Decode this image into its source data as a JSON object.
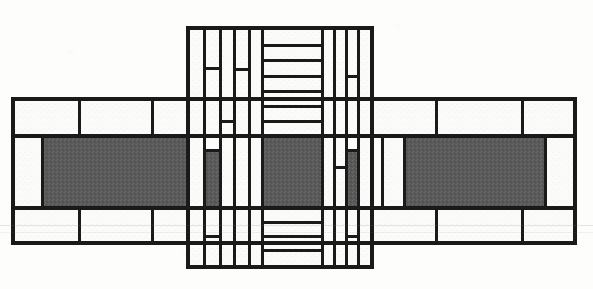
{
  "artwork": {
    "title": "Abstract Rectilinear Composition",
    "style": "de-stijl-architectural-plan",
    "medium": "line drawing with gray fills",
    "canvas": {
      "width": 593,
      "height": 289
    },
    "colors": {
      "background": "#fdfdfc",
      "stroke": "#1a1a1a",
      "fill_dark": "#5a5a5a",
      "fill_light": "#fbfbfa",
      "paper_tint": "#f5f4f1"
    },
    "stroke_width": 3,
    "description": "Cruciform layout: a wide horizontal band crossed by a tall central vertical column, subdivided into rectangular cells; three large dark-gray rectangles sit on the central horizontal axis."
  },
  "geometry": {
    "horizontal_band": {
      "name": "horizontal-band",
      "left": 13,
      "right": 575,
      "top": 99,
      "bottom": 243,
      "dark_top": 136,
      "dark_bottom": 208
    },
    "vertical_column": {
      "name": "vertical-column",
      "left": 188,
      "right": 372,
      "top": 28,
      "bottom": 267
    },
    "column_vlines": [
      188,
      204,
      220,
      234,
      249,
      262,
      322,
      334,
      346,
      358,
      372
    ],
    "left_wing": {
      "outline": [
        13,
        99,
        212,
        243
      ],
      "hlines": [
        99,
        136,
        208,
        243
      ],
      "vlines": [
        13,
        42,
        79,
        131,
        188,
        212
      ],
      "dark_rect": [
        42,
        136,
        188,
        208
      ]
    },
    "right_wing": {
      "outline": [
        382,
        99,
        575,
        243
      ],
      "hlines": [
        99,
        136,
        208,
        243
      ],
      "vlines": [
        382,
        404,
        436,
        492,
        545,
        575
      ],
      "dark_rect": [
        404,
        136,
        545,
        208
      ]
    },
    "center_dark_rect": [
      262,
      136,
      322,
      208
    ],
    "ladder_rungs_top": [
      45,
      60,
      76,
      91,
      106,
      121,
      136
    ],
    "ladder_rungs_bottom": [
      208,
      222,
      236,
      250,
      264
    ]
  },
  "cells": {
    "count_outlined": 58,
    "count_filled": 5,
    "note": "All cells are axis-aligned rectangles with black outlines."
  },
  "labels": {
    "none": "This image contains no text, labels, axes, or legend."
  }
}
